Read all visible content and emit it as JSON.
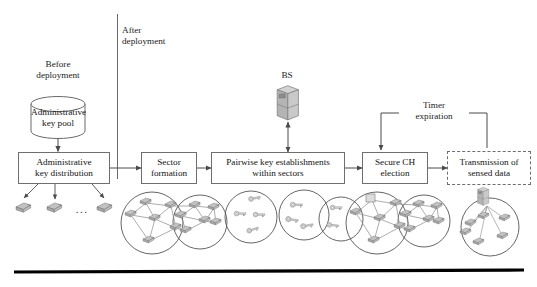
{
  "figure": {
    "type": "flowchart"
  },
  "phase_labels": {
    "before": "Before\ndeployment",
    "before_line1": "Before",
    "before_line2": "deployment",
    "after_line1": "After",
    "after_line2": "deployment"
  },
  "nodes": {
    "key_pool": {
      "shape": "cylinder",
      "line1": "Administrative",
      "line2": "key pool"
    },
    "key_distribution": {
      "shape": "rect",
      "line1": "Administrative",
      "line2": "key distribution"
    },
    "sector_formation": {
      "shape": "rect",
      "line1": "Sector",
      "line2": "formation"
    },
    "pairwise_keys": {
      "shape": "rect",
      "line1": "Pairwise key establishments",
      "line2": "within sectors"
    },
    "secure_ch_election": {
      "shape": "rect",
      "line1": "Secure CH",
      "line2": "election"
    },
    "transmission": {
      "shape": "rect-dashed",
      "line1": "Transmission of",
      "line2": "sensed data"
    },
    "base_station": {
      "shape": "server",
      "label": "BS"
    }
  },
  "edge_labels": {
    "timer_expiration_line1": "Timer",
    "timer_expiration_line2": "expiration"
  },
  "illustrations": {
    "distributed_nodes": {
      "name": "sensor-nodes-row",
      "ellipsis": "..."
    },
    "sectors": {
      "name": "two-overlapping-sector-clusters",
      "circles": 2
    },
    "key_circles": {
      "name": "pairwise-key-circles",
      "circles": 3
    },
    "ch_clusters": {
      "name": "cluster-head-clusters",
      "circles": 2
    },
    "data_transmission": {
      "name": "nodes-transmitting-to-bs",
      "circles": 1
    }
  },
  "colors": {
    "node_fill": "#b8b8b8",
    "node_stroke": "#6a6a6a",
    "line": "#4a4a4a",
    "box_stroke": "#6e6e6e",
    "rule": "#000000",
    "text": "#1a1a1a",
    "background": "#ffffff"
  }
}
